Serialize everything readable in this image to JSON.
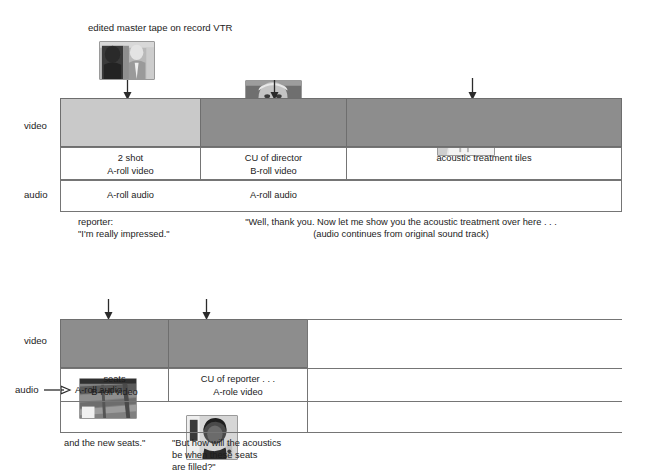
{
  "figure": {
    "title": "edited master tape on record VTR",
    "type": "video-audio-timeline-diagram"
  },
  "timeline_top": {
    "row_labels": {
      "video": "video",
      "audio": "audio"
    },
    "thumbnails": [
      {
        "name": "two-shot-reporter-and-director",
        "alt": "2 shot of reporter and director talking"
      },
      {
        "name": "cu-of-director",
        "alt": "close up of director"
      },
      {
        "name": "acoustic-treatment-tiles",
        "alt": "acoustic treatment tiles on wall"
      }
    ],
    "video_segments": [
      {
        "shade": "light",
        "line1": "2 shot",
        "line2": "A-roll video"
      },
      {
        "shade": "dark",
        "line1": "CU of director",
        "line2": "B-roll video"
      },
      {
        "shade": "dark",
        "line1": "acoustic treatment tiles",
        "line2": ""
      }
    ],
    "audio_segments": [
      {
        "label": "A-roll audio"
      },
      {
        "label": "A-roll audio"
      }
    ],
    "narration": [
      {
        "line1": "reporter:",
        "line2": "\"I'm really impressed.\""
      },
      {
        "line1": "\"Well, thank you. Now let me show you the acoustic treatment over here . . .",
        "line2": "(audio continues from original sound track)"
      }
    ]
  },
  "timeline_bottom": {
    "row_labels": {
      "video": "video",
      "audio": "audio"
    },
    "thumbnails": [
      {
        "name": "seats",
        "alt": "rows of theatre seats"
      },
      {
        "name": "cu-of-reporter",
        "alt": "close up of reporter"
      }
    ],
    "video_segments": [
      {
        "shade": "dark",
        "line1": "seats",
        "line2": "B-roll video"
      },
      {
        "shade": "dark",
        "line1": "CU of reporter . . .",
        "line2": "A-role video"
      }
    ],
    "audio_segments": [
      {
        "label": "A-roll audio"
      }
    ],
    "narration": [
      {
        "line1": "and the new seats.\"",
        "line2": "",
        "line3": ""
      },
      {
        "line1": "\"But how will the acoustics",
        "line2": "be when these seats",
        "line3": "are filled?\""
      }
    ]
  },
  "colors": {
    "light_video": "#c9c9c9",
    "dark_video": "#8d8d8d",
    "line": "#757575",
    "text": "#1c1c1c"
  }
}
